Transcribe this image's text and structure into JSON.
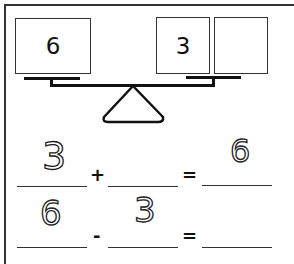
{
  "worksheet": {
    "balance": {
      "left_pan": [
        "6"
      ],
      "right_pan": [
        "3",
        ""
      ]
    },
    "equations": [
      {
        "a": "3",
        "op": "+",
        "b": "",
        "eq": "=",
        "result": "6"
      },
      {
        "a": "6",
        "op": "-",
        "b": "3",
        "eq": "=",
        "result": ""
      }
    ]
  }
}
